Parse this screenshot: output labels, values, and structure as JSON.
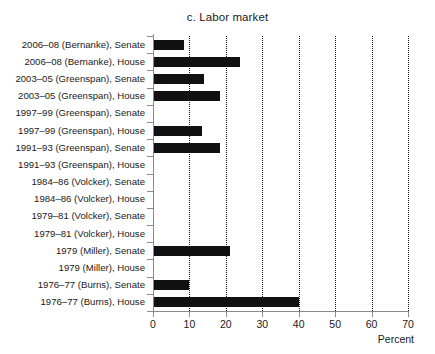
{
  "chart_data": {
    "type": "bar",
    "orientation": "horizontal",
    "title": "c. Labor market",
    "xlabel": "Percent",
    "ylabel": "",
    "xlim": [
      0,
      70
    ],
    "xticks": [
      0,
      10,
      20,
      30,
      40,
      50,
      60,
      70
    ],
    "xticklabels": [
      "0",
      "10",
      "20",
      "30",
      "40",
      "50",
      "60",
      "70"
    ],
    "grid": "vertical dotted gridlines at every x tick",
    "legend": "none",
    "bar_color": "#111111",
    "categories": [
      "2006–08 (Bernanke), Senate",
      "2006–08 (Bernanke), House",
      "2003–05 (Greenspan), Senate",
      "2003–05 (Greenspan), House",
      "1997–99 (Greenspan), Senate",
      "1997–99 (Greenspan), House",
      "1991–93 (Greenspan), Senate",
      "1991–93 (Greenspan), House",
      "1984–86 (Volcker), Senate",
      "1984–86 (Volcker), House",
      "1979–81 (Volcker), Senate",
      "1979–81 (Volcker), House",
      "1979 (Miller), Senate",
      "1979 (Miller), House",
      "1976–77 (Burns), Senate",
      "1976–77 (Burns), House"
    ],
    "values": [
      8.5,
      24,
      14,
      18.5,
      0,
      13.5,
      18.3,
      0,
      0,
      0,
      0,
      0,
      21,
      0,
      10,
      40
    ]
  }
}
